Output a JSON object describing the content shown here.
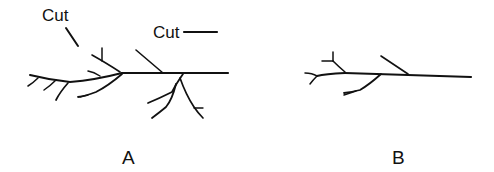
{
  "figure": {
    "annotations": {
      "cut_left": "Cut",
      "cut_right": "Cut"
    },
    "panels": [
      {
        "id": "A",
        "label": "A",
        "description": "Branched structure with several side branches; two cut sites indicated"
      },
      {
        "id": "B",
        "label": "B",
        "description": "Same structure after pruning; fewer side branches"
      }
    ],
    "colors": {
      "ink": "#111111",
      "background": "#ffffff"
    }
  }
}
